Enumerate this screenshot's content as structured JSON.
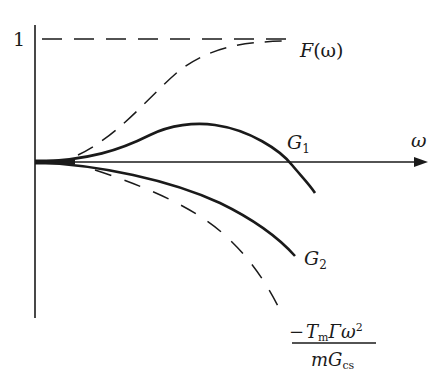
{
  "diagram": {
    "type": "curve-sketch",
    "axes": {
      "x_label": "ω",
      "y_tick_label": "1"
    },
    "curves": [
      {
        "id": "F",
        "label_main": "F",
        "label_suffix": "(ω)",
        "style": "dashed",
        "description": "rises from 0 to asymptote 1"
      },
      {
        "id": "G1",
        "label_main": "G",
        "label_sub": "1",
        "style": "solid",
        "description": "rises to a maximum then falls below zero"
      },
      {
        "id": "G2",
        "label_main": "G",
        "label_sub": "2",
        "style": "solid",
        "description": "decreases monotonically below zero"
      },
      {
        "id": "parabola",
        "label_num_minus": "−",
        "label_num_T": "T",
        "label_num_T_sub": "m",
        "label_num_rest": "Γω",
        "label_num_sup": "2",
        "label_den_m": "mG",
        "label_den_sub": "cs",
        "style": "dashed",
        "description": "downward parabola asymptote"
      }
    ],
    "asymptote_label": "1"
  },
  "colors": {
    "ink": "#1a1a1a",
    "background": "#ffffff"
  }
}
